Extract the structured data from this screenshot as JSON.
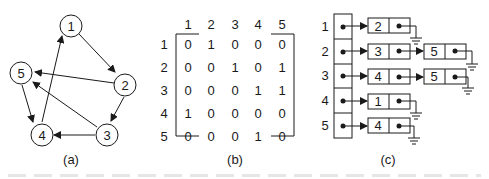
{
  "panels": {
    "a": {
      "caption": "(a)",
      "nodes": [
        {
          "id": "1",
          "label": "1"
        },
        {
          "id": "2",
          "label": "2"
        },
        {
          "id": "3",
          "label": "3"
        },
        {
          "id": "4",
          "label": "4"
        },
        {
          "id": "5",
          "label": "5"
        }
      ],
      "edges": [
        [
          "1",
          "2"
        ],
        [
          "2",
          "5"
        ],
        [
          "2",
          "3"
        ],
        [
          "3",
          "5"
        ],
        [
          "3",
          "4"
        ],
        [
          "4",
          "1"
        ],
        [
          "5",
          "4"
        ]
      ]
    },
    "b": {
      "caption": "(b)",
      "col_headers": [
        "1",
        "2",
        "3",
        "4",
        "5"
      ],
      "row_headers": [
        "1",
        "2",
        "3",
        "4",
        "5"
      ],
      "rows": [
        [
          "0",
          "1",
          "0",
          "0",
          "0"
        ],
        [
          "0",
          "0",
          "1",
          "0",
          "1"
        ],
        [
          "0",
          "0",
          "0",
          "1",
          "1"
        ],
        [
          "1",
          "0",
          "0",
          "0",
          "0"
        ],
        [
          "0",
          "0",
          "0",
          "1",
          "0"
        ]
      ]
    },
    "c": {
      "caption": "(c)",
      "row_labels": [
        "1",
        "2",
        "3",
        "4",
        "5"
      ],
      "lists": [
        [
          "2"
        ],
        [
          "3",
          "5"
        ],
        [
          "4",
          "5"
        ],
        [
          "1"
        ],
        [
          "4"
        ]
      ]
    }
  }
}
